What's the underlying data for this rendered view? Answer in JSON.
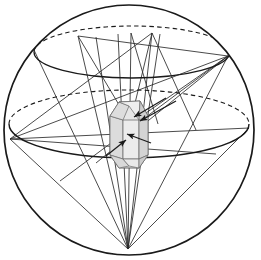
{
  "figure": {
    "background_color": "#ffffff",
    "line_color": "#1a1a1a",
    "ray_color": "#2b2b2b",
    "crystal_fill": "#e3e3e3",
    "crystal_face_fill": "#d2d2d2",
    "crystal_stroke": "#3a3a3a",
    "width": 261,
    "height": 260
  },
  "sphere": {
    "name": "reference-sphere",
    "cx": 129,
    "cy": 130,
    "r": 125,
    "stroke_width": 1.7
  },
  "latitude_circles": [
    {
      "name": "upper-latitude-circle",
      "cx": 132,
      "cy": 52,
      "rx": 98,
      "ry": 26,
      "front_solid": true,
      "back_dashed": true
    },
    {
      "name": "equator-latitude-circle",
      "cx": 129,
      "cy": 124,
      "rx": 120,
      "ry": 34,
      "front_solid": true,
      "back_dashed": true
    }
  ],
  "vertices": [
    {
      "name": "bottom-convergence-point",
      "x": 128,
      "y": 249
    },
    {
      "name": "left-equator-point",
      "x": 10,
      "y": 139
    },
    {
      "name": "right-equator-point",
      "x": 249,
      "y": 128
    },
    {
      "name": "upper-right-point",
      "x": 228,
      "y": 56
    },
    {
      "name": "upper-left-point",
      "x": 78,
      "y": 36
    },
    {
      "name": "upper-mid-point",
      "x": 152,
      "y": 33
    }
  ],
  "crystal": {
    "name": "hexagonal-crystal",
    "cx": 129,
    "cy": 133,
    "half_width": 19,
    "body_top": 116,
    "body_bottom": 155,
    "apex_top": 101,
    "apex_bottom": 168
  },
  "rays": {
    "label": "diffracted beam rays",
    "from_bottom_count": 9,
    "from_left_count": 4,
    "from_upper_right_count": 3
  },
  "arrows": [
    {
      "name": "incident-beam-arrow",
      "x1": 176,
      "y1": 101,
      "x2": 140,
      "y2": 121
    },
    {
      "name": "diffracted-beam-arrow",
      "x1": 166,
      "y1": 98,
      "x2": 134,
      "y2": 117
    },
    {
      "name": "internal-vector-arrow",
      "x1": 151,
      "y1": 143,
      "x2": 127,
      "y2": 134
    },
    {
      "name": "lower-left-arrow",
      "x1": 106,
      "y1": 156,
      "x2": 126,
      "y2": 140
    }
  ]
}
